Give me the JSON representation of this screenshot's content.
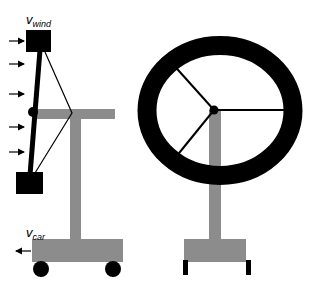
{
  "figure": {
    "left_panel": {
      "name": "wind-cart-pendulum",
      "wind_label": {
        "main": "v",
        "sub": "wind"
      },
      "car_label": {
        "main": "v",
        "sub": "car"
      },
      "wind_arrow_y": [
        41,
        64,
        94,
        127,
        152
      ]
    },
    "right_panel": {
      "name": "wheel-on-stand",
      "spokes": 3
    },
    "colors": {
      "black": "#000000",
      "gray": "#8c8c8c",
      "background": "#ffffff"
    }
  }
}
